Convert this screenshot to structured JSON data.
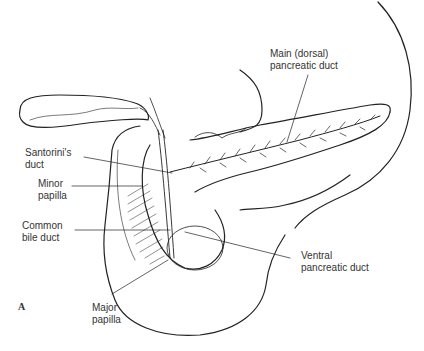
{
  "figure": {
    "panel_letter": "A",
    "labels": {
      "main_duct": "Main (dorsal)\npancreatic duct",
      "santorini": "Santorini's\nduct",
      "minor_papilla": "Minor\npapilla",
      "common_bile_duct": "Common\nbile duct",
      "ventral_duct": "Ventral\npancreatic duct",
      "major_papilla": "Major\npapilla"
    },
    "colors": {
      "line": "#222222",
      "label_text": "#333333",
      "background": "#ffffff"
    }
  }
}
